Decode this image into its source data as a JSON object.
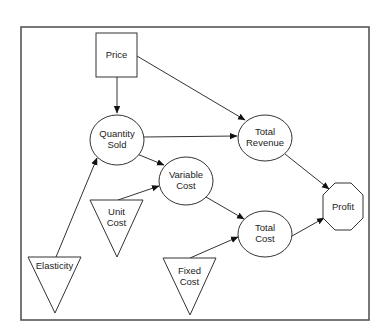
{
  "diagram": {
    "type": "influence-diagram",
    "nodes": {
      "price": {
        "lines": [
          "Price"
        ],
        "shape": "rectangle",
        "role": "decision"
      },
      "quantity_sold": {
        "lines": [
          "Quantity",
          "Sold"
        ],
        "shape": "ellipse",
        "role": "intermediate"
      },
      "total_revenue": {
        "lines": [
          "Total",
          "Revenue"
        ],
        "shape": "ellipse",
        "role": "intermediate"
      },
      "variable_cost": {
        "lines": [
          "Variable",
          "Cost"
        ],
        "shape": "ellipse",
        "role": "intermediate"
      },
      "total_cost": {
        "lines": [
          "Total",
          "Cost"
        ],
        "shape": "ellipse",
        "role": "intermediate"
      },
      "profit": {
        "lines": [
          "Profit"
        ],
        "shape": "octagon",
        "role": "objective"
      },
      "unit_cost": {
        "lines": [
          "Unit",
          "Cost"
        ],
        "shape": "inverted-triangle",
        "role": "input"
      },
      "elasticity": {
        "lines": [
          "Elasticity"
        ],
        "shape": "inverted-triangle",
        "role": "input"
      },
      "fixed_cost": {
        "lines": [
          "Fixed",
          "Cost"
        ],
        "shape": "inverted-triangle",
        "role": "input"
      }
    },
    "edges": [
      {
        "from": "Price",
        "to": "Quantity Sold"
      },
      {
        "from": "Price",
        "to": "Total Revenue"
      },
      {
        "from": "Quantity Sold",
        "to": "Total Revenue"
      },
      {
        "from": "Quantity Sold",
        "to": "Variable Cost"
      },
      {
        "from": "Unit Cost",
        "to": "Variable Cost"
      },
      {
        "from": "Elasticity",
        "to": "Quantity Sold"
      },
      {
        "from": "Variable Cost",
        "to": "Total Cost"
      },
      {
        "from": "Fixed Cost",
        "to": "Total Cost"
      },
      {
        "from": "Total Revenue",
        "to": "Profit"
      },
      {
        "from": "Total Cost",
        "to": "Profit"
      }
    ]
  }
}
